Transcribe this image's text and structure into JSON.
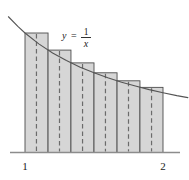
{
  "figure": {
    "curve_label": {
      "lhs": "y",
      "equals": "=",
      "numerator": "1",
      "denominator": "x",
      "full": "y = 1/x"
    },
    "x_axis": {
      "tick_labels": [
        "1",
        "2"
      ],
      "tick_values": [
        1,
        2
      ]
    },
    "colors": {
      "bar_fill": "#d6d6d6",
      "bar_stroke": "#4d4d4d",
      "curve_stroke": "#555555",
      "axis_stroke": "#8c8c8c",
      "dashed_stroke": "#6b6b6b",
      "background": "#ffffff"
    }
  },
  "chart_data": {
    "type": "area",
    "xlabel": "",
    "ylabel": "",
    "xlim": [
      0.88,
      2.18
    ],
    "ylim": [
      0,
      1.14
    ],
    "grid": false,
    "legend": "none",
    "function": "y = 1/x",
    "n_rectangles": 6,
    "rule": "left-endpoint",
    "delta_x": 0.16667,
    "categories": [
      "[1.000,1.167]",
      "[1.167,1.333]",
      "[1.333,1.500]",
      "[1.500,1.667]",
      "[1.667,1.833]",
      "[1.833,2.000]"
    ],
    "series": [
      {
        "name": "rectangle height (1/x at left endpoint)",
        "values": [
          1.0,
          0.857,
          0.75,
          0.667,
          0.6,
          0.545
        ]
      },
      {
        "name": "rectangle left x",
        "values": [
          1.0,
          1.167,
          1.333,
          1.5,
          1.667,
          1.833
        ]
      },
      {
        "name": "rectangle right x",
        "values": [
          1.167,
          1.333,
          1.5,
          1.667,
          1.833,
          2.0
        ]
      },
      {
        "name": "dashed midline x (midpoint)",
        "values": [
          1.083,
          1.25,
          1.417,
          1.583,
          1.75,
          1.917
        ]
      }
    ],
    "curve": {
      "name": "y = 1/x",
      "x": [
        0.88,
        0.95,
        1.0,
        1.1,
        1.2,
        1.3,
        1.4,
        1.5,
        1.6,
        1.7,
        1.8,
        1.9,
        2.0,
        2.1,
        2.18
      ],
      "y": [
        1.136,
        1.053,
        1.0,
        0.909,
        0.833,
        0.769,
        0.714,
        0.667,
        0.625,
        0.588,
        0.556,
        0.526,
        0.5,
        0.476,
        0.459
      ]
    },
    "annotations": [
      {
        "text": "y = 1/x",
        "x": 1.28,
        "y": 0.98
      }
    ]
  }
}
